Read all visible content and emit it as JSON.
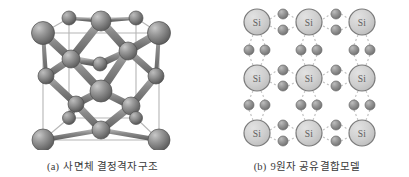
{
  "figure": {
    "background_color": "#ffffff",
    "panels": [
      {
        "id": "a",
        "caption_label": "(a)",
        "caption_text": "사면체 결정격자구조",
        "kind": "tetrahedral-crystal-lattice-diagram",
        "text_color": "#3a3a3a"
      },
      {
        "id": "b",
        "caption_label": "(b)",
        "caption_text": "9원자 공유결합모델",
        "kind": "covalent-bond-model-diagram",
        "text_color": "#3a3a3a"
      }
    ]
  },
  "lattice": {
    "atom_color_light": "#a6a6a6",
    "atom_color_dark": "#5a5a5a",
    "bond_color": "#7b7b7b",
    "cell_edge_color": "#b4b4b4",
    "corner_atoms": [
      {
        "cx": 27,
        "cy": 27,
        "r": 11
      },
      {
        "cx": 143,
        "cy": 27,
        "r": 11
      },
      {
        "cx": 27,
        "cy": 134,
        "r": 11
      },
      {
        "cx": 143,
        "cy": 134,
        "r": 11
      },
      {
        "cx": 53,
        "cy": 12,
        "r": 7
      },
      {
        "cx": 120,
        "cy": 12,
        "r": 7
      },
      {
        "cx": 53,
        "cy": 112,
        "r": 7
      },
      {
        "cx": 120,
        "cy": 112,
        "r": 7
      }
    ],
    "face_atoms": [
      {
        "cx": 85,
        "cy": 15,
        "r": 10
      },
      {
        "cx": 85,
        "cy": 85,
        "r": 11
      },
      {
        "cx": 85,
        "cy": 124,
        "r": 9
      },
      {
        "cx": 30,
        "cy": 70,
        "r": 8
      },
      {
        "cx": 140,
        "cy": 70,
        "r": 8
      }
    ],
    "interior_atoms": [
      {
        "cx": 55,
        "cy": 53,
        "r": 9
      },
      {
        "cx": 112,
        "cy": 45,
        "r": 9
      },
      {
        "cx": 60,
        "cy": 98,
        "r": 8
      },
      {
        "cx": 115,
        "cy": 100,
        "r": 9
      },
      {
        "cx": 84,
        "cy": 58,
        "r": 7
      }
    ]
  },
  "bond_model": {
    "si_label": "Si",
    "si_fill_color": "#cfcfcf",
    "si_stroke_color": "#7a7a7a",
    "si_label_color": "#5d5d5d",
    "electron_color": "#8c8c8c",
    "electron_stroke_color": "#6a6a6a",
    "bond_line_color": "#bdbdbd",
    "si_radius": 13,
    "electron_radius": 5,
    "atom_count": 9,
    "grid_rows": 3,
    "grid_cols": 3,
    "si_atoms": [
      {
        "row": 0,
        "col": 0,
        "cx": 25,
        "cy": 22
      },
      {
        "row": 0,
        "col": 1,
        "cx": 77,
        "cy": 22
      },
      {
        "row": 0,
        "col": 2,
        "cx": 130,
        "cy": 22
      },
      {
        "row": 1,
        "col": 0,
        "cx": 25,
        "cy": 78
      },
      {
        "row": 1,
        "col": 1,
        "cx": 77,
        "cy": 78
      },
      {
        "row": 1,
        "col": 2,
        "cx": 130,
        "cy": 78
      },
      {
        "row": 2,
        "col": 0,
        "cx": 25,
        "cy": 133
      },
      {
        "row": 2,
        "col": 1,
        "cx": 77,
        "cy": 133
      },
      {
        "row": 2,
        "col": 2,
        "cx": 130,
        "cy": 133
      }
    ],
    "horizontal_electron_pairs": [
      {
        "cx": 51,
        "cy": 14
      },
      {
        "cx": 51,
        "cy": 30
      },
      {
        "cx": 104,
        "cy": 14
      },
      {
        "cx": 104,
        "cy": 30
      },
      {
        "cx": 51,
        "cy": 70
      },
      {
        "cx": 51,
        "cy": 86
      },
      {
        "cx": 104,
        "cy": 70
      },
      {
        "cx": 104,
        "cy": 86
      },
      {
        "cx": 51,
        "cy": 125
      },
      {
        "cx": 51,
        "cy": 141
      },
      {
        "cx": 104,
        "cy": 125
      },
      {
        "cx": 104,
        "cy": 141
      }
    ],
    "vertical_electron_pairs": [
      {
        "cx": 17,
        "cy": 50
      },
      {
        "cx": 33,
        "cy": 50
      },
      {
        "cx": 69,
        "cy": 50
      },
      {
        "cx": 85,
        "cy": 50
      },
      {
        "cx": 122,
        "cy": 50
      },
      {
        "cx": 138,
        "cy": 50
      },
      {
        "cx": 17,
        "cy": 105
      },
      {
        "cx": 33,
        "cy": 105
      },
      {
        "cx": 69,
        "cy": 105
      },
      {
        "cx": 85,
        "cy": 105
      },
      {
        "cx": 122,
        "cy": 105
      },
      {
        "cx": 138,
        "cy": 105
      }
    ]
  }
}
